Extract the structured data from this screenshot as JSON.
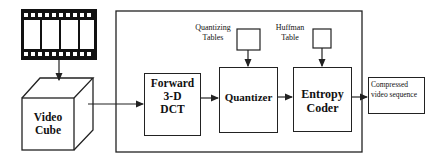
{
  "diagram": {
    "type": "block-diagram",
    "nodes": {
      "film": {
        "label": "",
        "icon": "film-strip-icon",
        "frames": 4
      },
      "cube": {
        "line1": "Video",
        "line2": "Cube"
      },
      "dct": {
        "line1": "Forward",
        "line2": "3-D",
        "line3": "DCT"
      },
      "quant_table": {
        "line1": "Quantizing",
        "line2": "Tables"
      },
      "quantizer": {
        "label": "Quantizer"
      },
      "huff_table": {
        "line1": "Huffman",
        "line2": "Table"
      },
      "entropy": {
        "line1": "Entropy",
        "line2": "Coder"
      },
      "output": {
        "line1": "Compressed",
        "line2": "video sequence"
      }
    },
    "edges": [
      [
        "film",
        "cube"
      ],
      [
        "cube",
        "dct"
      ],
      [
        "dct",
        "quantizer"
      ],
      [
        "quant_table",
        "quantizer"
      ],
      [
        "quantizer",
        "entropy"
      ],
      [
        "huff_table",
        "entropy"
      ],
      [
        "entropy",
        "output"
      ]
    ],
    "colors": {
      "line": "#222222",
      "film": "#111111",
      "background": "#ffffff"
    }
  }
}
